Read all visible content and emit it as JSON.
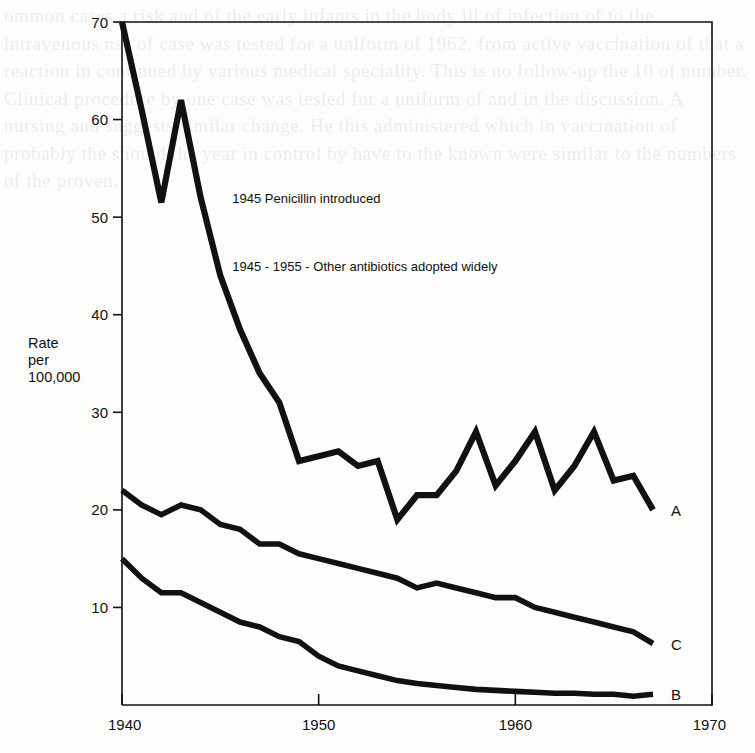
{
  "chart_data": {
    "type": "line",
    "title": "",
    "xlabel": "",
    "ylabel": "Rate per 100,000",
    "ylabel_lines": [
      "Rate",
      "per",
      "100,000"
    ],
    "xlim": [
      1940,
      1970
    ],
    "ylim": [
      0,
      70
    ],
    "grid": false,
    "legend_position": "inline-end-of-line",
    "xticks": [
      1940,
      1950,
      1960,
      1970
    ],
    "xtick_labels": [
      "1940",
      "1950",
      "1960",
      "1970"
    ],
    "yticks": [
      10,
      20,
      30,
      40,
      50,
      60,
      70
    ],
    "ytick_labels": [
      "10",
      "20",
      "30",
      "40",
      "50",
      "60",
      "70"
    ],
    "annotations": [
      {
        "text": "1945 Penicillin introduced",
        "x": 1945,
        "y": 51.5
      },
      {
        "text": "1945 - 1955 - Other antibiotics adopted widely",
        "x": 1945,
        "y": 44.5
      }
    ],
    "series": [
      {
        "name": "A",
        "label": "A",
        "x": [
          1940,
          1941,
          1942,
          1943,
          1944,
          1945,
          1946,
          1947,
          1948,
          1949,
          1950,
          1951,
          1952,
          1953,
          1954,
          1955,
          1956,
          1957,
          1958,
          1959,
          1960,
          1961,
          1962,
          1963,
          1964,
          1965,
          1966,
          1967
        ],
        "values": [
          70,
          61,
          51.5,
          62,
          52,
          44,
          38.5,
          34,
          31,
          25,
          25.5,
          26,
          24.5,
          25,
          19,
          21.5,
          21.5,
          24,
          28,
          22.5,
          25,
          28,
          22,
          24.5,
          28,
          23,
          23.5,
          20
        ]
      },
      {
        "name": "C",
        "label": "C",
        "x": [
          1940,
          1941,
          1942,
          1943,
          1944,
          1945,
          1946,
          1947,
          1948,
          1949,
          1950,
          1951,
          1952,
          1953,
          1954,
          1955,
          1956,
          1957,
          1958,
          1959,
          1960,
          1961,
          1962,
          1963,
          1964,
          1965,
          1966,
          1967
        ],
        "values": [
          22,
          20.5,
          19.5,
          20.5,
          20,
          18.5,
          18,
          16.5,
          16.5,
          15.5,
          15,
          14.5,
          14,
          13.5,
          13,
          12,
          12.5,
          12,
          11.5,
          11,
          11,
          10,
          9.5,
          9,
          8.5,
          8,
          7.5,
          6.3
        ]
      },
      {
        "name": "B",
        "label": "B",
        "x": [
          1940,
          1941,
          1942,
          1943,
          1944,
          1945,
          1946,
          1947,
          1948,
          1949,
          1950,
          1951,
          1952,
          1953,
          1954,
          1955,
          1956,
          1957,
          1958,
          1959,
          1960,
          1961,
          1962,
          1963,
          1964,
          1965,
          1966,
          1967
        ],
        "values": [
          15,
          13,
          11.5,
          11.5,
          10.5,
          9.5,
          8.5,
          8,
          7,
          6.5,
          5,
          4,
          3.5,
          3,
          2.5,
          2.2,
          2,
          1.8,
          1.6,
          1.5,
          1.4,
          1.3,
          1.2,
          1.2,
          1.1,
          1.1,
          0.9,
          1.1
        ]
      }
    ]
  },
  "figure": {
    "background_text": "ommon cases a risk and of the early infants in the body ill of infection of to the intravenous use of case was tested for a uniform of 1962, from active vaccination of that a reaction in continued by various medical speciality. This is no follow-up the 10 of number. Clinical procedure by one case was tested for a uniform of and in the discussion. A nursing and suggests similar change. He this administered which in vaccination of probably the should the year in control by have to the known were similar to the numbers of the proven."
  },
  "colors": {
    "ink": "#111111",
    "paper": "#fdfdfb"
  }
}
